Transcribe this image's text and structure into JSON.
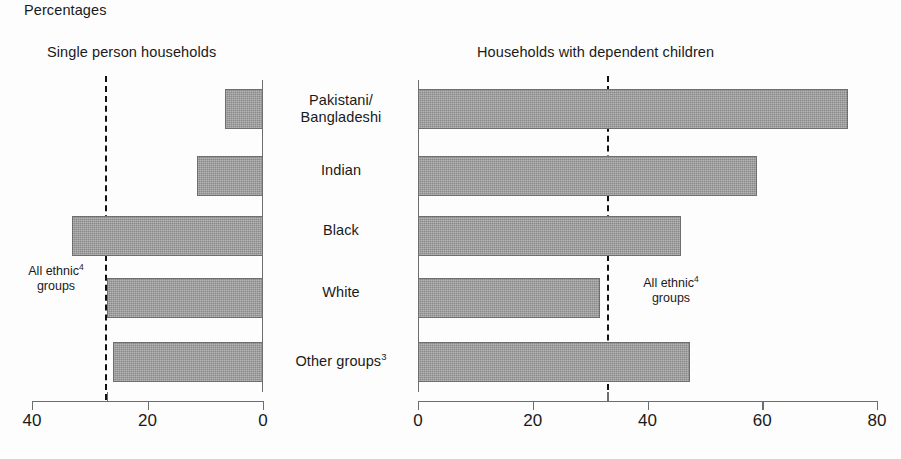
{
  "header": {
    "units_label": "Percentages"
  },
  "panels": {
    "left": {
      "title": "Single person households"
    },
    "right": {
      "title": "Households with dependent children"
    }
  },
  "annotations": {
    "left": {
      "line1": "All ethnic",
      "sup": "4",
      "line2": "groups"
    },
    "right": {
      "line1": "All ethnic",
      "sup": "4",
      "line2": "groups"
    }
  },
  "footnote": {
    "text": ""
  },
  "chart_data": {
    "type": "bar",
    "title": "Percentages",
    "orientation": "horizontal",
    "layout": "two-panel back-to-back (pyramid)",
    "categories": [
      "Pakistani/Bangladeshi",
      "Indian",
      "Black",
      "White",
      "Other groups"
    ],
    "category_superscripts": [
      "",
      "",
      "",
      "",
      "3"
    ],
    "panels": [
      {
        "name": "left",
        "title": "Single person households",
        "xlabel": "",
        "ylabel": "",
        "direction": "right-to-left",
        "xlim": [
          0,
          40
        ],
        "ticks": [
          40,
          20,
          0
        ],
        "tick_labels": [
          "40",
          "20",
          "0"
        ],
        "values": [
          6.5,
          11.5,
          33.0,
          27.0,
          26.0
        ],
        "reference_line": {
          "label": "All ethnic groups",
          "value": 27.0
        },
        "grid": false
      },
      {
        "name": "right",
        "title": "Households with dependent children",
        "xlabel": "",
        "ylabel": "",
        "direction": "left-to-right",
        "xlim": [
          0,
          80
        ],
        "ticks": [
          0,
          20,
          40,
          60,
          80
        ],
        "tick_labels": [
          "0",
          "20",
          "40",
          "60",
          "80"
        ],
        "values": [
          75.0,
          59.0,
          45.8,
          31.8,
          47.4
        ],
        "reference_line": {
          "label": "All ethnic groups",
          "value": 33.0
        },
        "grid": false
      }
    ],
    "legend": {
      "position": "none",
      "entries": []
    },
    "colors": {
      "bar_fill": "#898989",
      "bar_stroke": "#6f6f6f",
      "axis": "#6d6d6d",
      "reference_line": "#111111"
    }
  }
}
